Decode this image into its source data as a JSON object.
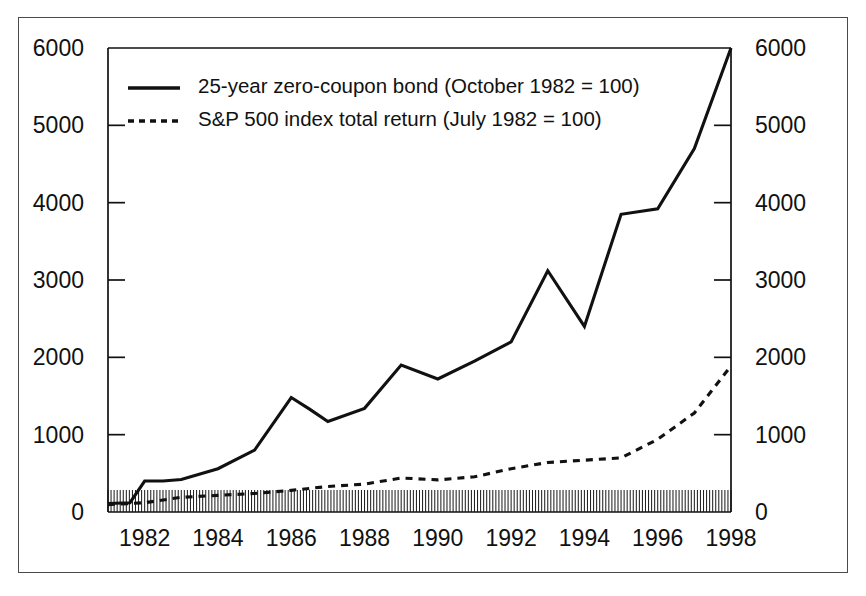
{
  "figure": {
    "background_color": "#ffffff",
    "frame_color": "#4a4a4a",
    "ink_color": "#111111"
  },
  "chart_data": {
    "type": "line",
    "title": "",
    "subtitle": "",
    "xlabel": "",
    "ylabel": "",
    "y2label": "",
    "xlim": [
      1981.0,
      1998.0
    ],
    "ylim": [
      0,
      6000
    ],
    "y2lim": [
      0,
      6000
    ],
    "grid": false,
    "legend_position": "upper-left-inside",
    "y_ticks": [
      0,
      1000,
      2000,
      3000,
      4000,
      5000,
      6000
    ],
    "y_tick_labels": [
      "0",
      "1000",
      "2000",
      "3000",
      "4000",
      "5000",
      "6000"
    ],
    "y2_ticks": [
      0,
      1000,
      2000,
      3000,
      4000,
      5000,
      6000
    ],
    "y2_tick_labels": [
      "0",
      "1000",
      "2000",
      "3000",
      "4000",
      "5000",
      "6000"
    ],
    "x_ticks": [
      1982,
      1984,
      1986,
      1988,
      1990,
      1992,
      1994,
      1996,
      1998
    ],
    "x_tick_labels": [
      "1982",
      "1984",
      "1986",
      "1988",
      "1990",
      "1992",
      "1994",
      "1996",
      "1998"
    ],
    "x_minor_ticks_per_year": 12,
    "x_minor_tick_note": "monthly tick marks along baseline",
    "series": [
      {
        "name": "25-year zero-coupon bond (October 1982 = 100)",
        "style": "solid",
        "legend_label": "25-year zero-coupon bond (October 1982 = 100)",
        "x": [
          1981.0,
          1981.6,
          1982.0,
          1982.5,
          1983.0,
          1984.0,
          1985.0,
          1986.0,
          1986.5,
          1987.0,
          1988.0,
          1989.0,
          1990.0,
          1991.0,
          1992.0,
          1993.0,
          1994.0,
          1995.0,
          1996.0,
          1997.0,
          1998.0
        ],
        "values": [
          110,
          120,
          400,
          400,
          420,
          560,
          800,
          1480,
          1330,
          1170,
          1340,
          1900,
          1720,
          1950,
          2200,
          3120,
          2400,
          3850,
          3920,
          4700,
          6000
        ]
      },
      {
        "name": "S&P 500 index total return (July 1982 = 100)",
        "style": "dashed",
        "legend_label": "S&P 500 index total return (July 1982 = 100)",
        "x": [
          1981.0,
          1982.0,
          1983.0,
          1984.0,
          1985.0,
          1986.0,
          1987.0,
          1988.0,
          1989.0,
          1990.0,
          1991.0,
          1992.0,
          1993.0,
          1994.0,
          1995.0,
          1996.0,
          1997.0,
          1998.0
        ],
        "values": [
          95,
          120,
          190,
          215,
          240,
          280,
          330,
          360,
          440,
          415,
          455,
          560,
          640,
          670,
          700,
          940,
          1280,
          1890
        ]
      }
    ]
  },
  "legend": {
    "entries": [
      {
        "label": "25-year zero-coupon bond (October 1982 = 100)",
        "style": "solid"
      },
      {
        "label": "S&P 500 index total return (July 1982 = 100)",
        "style": "dashed"
      }
    ]
  }
}
